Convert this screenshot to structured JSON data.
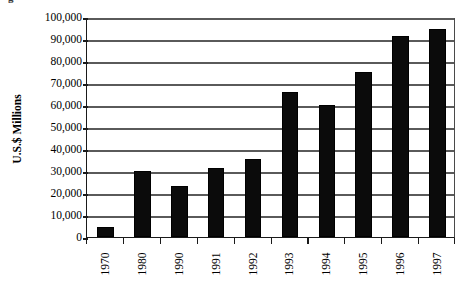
{
  "figure": {
    "caption_fragment": "g",
    "background_color": "#ffffff"
  },
  "chart_data": {
    "type": "bar",
    "title": "",
    "subtitle": "",
    "xlabel": "",
    "ylabel": "U.S.$ Millions",
    "categories": [
      "1970",
      "1980",
      "1990",
      "1991",
      "1992",
      "1993",
      "1994",
      "1995",
      "1996",
      "1997"
    ],
    "values": [
      4500,
      30000,
      23000,
      31500,
      35500,
      66000,
      60000,
      75000,
      91500,
      94500
    ],
    "ylim": [
      0,
      100000
    ],
    "ytick_values": [
      0,
      10000,
      20000,
      30000,
      40000,
      50000,
      60000,
      70000,
      80000,
      90000,
      100000
    ],
    "ytick_labels": [
      "0",
      "10,000",
      "20,000",
      "30,000",
      "40,000",
      "50,000",
      "60,000",
      "70,000",
      "80,000",
      "90,000",
      "100,000"
    ],
    "xtick_labels_rotation": 90,
    "grid": true,
    "grid_axis": "y",
    "legend": false,
    "legend_position": "none",
    "bar_color": "#0b0b0b",
    "grid_color": "#5a5a5a",
    "axis_color": "#1a1a1a",
    "series": [
      {
        "name": "",
        "values": [
          4500,
          30000,
          23000,
          31500,
          35500,
          66000,
          60000,
          75000,
          91500,
          94500
        ]
      }
    ]
  }
}
